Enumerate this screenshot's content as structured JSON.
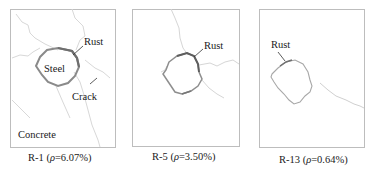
{
  "figure": {
    "panels": [
      {
        "id": "R-1",
        "caption_prefix": "R-1 (",
        "rho_symbol": "ρ",
        "caption_suffix": "=6.07%)",
        "labels": {
          "rust": "Rust",
          "steel": "Steel",
          "crack": "Crack",
          "concrete": "Concrete"
        }
      },
      {
        "id": "R-5",
        "caption_prefix": "R-5 (",
        "rho_symbol": "ρ",
        "caption_suffix": "=3.50%)",
        "labels": {
          "rust": "Rust"
        }
      },
      {
        "id": "R-13",
        "caption_prefix": "R-13 (",
        "rho_symbol": "ρ",
        "caption_suffix": "=0.64%)",
        "labels": {
          "rust": "Rust"
        }
      }
    ],
    "colors": {
      "frame": "#bdbdbd",
      "crack": "#d6d6d6",
      "rust_heavy": "#7a7a7a",
      "rust_light": "#b0b0b0",
      "text": "#1a1a1a"
    }
  }
}
